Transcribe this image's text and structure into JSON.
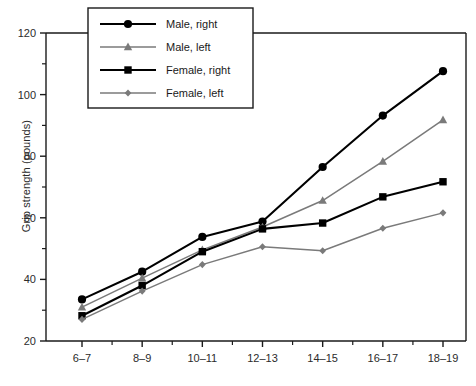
{
  "chart_data": {
    "type": "line",
    "title": "",
    "xlabel": "",
    "ylabel": "Grip strength (pounds)",
    "categories": [
      "6–7",
      "8–9",
      "10–11",
      "12–13",
      "14–15",
      "16–17",
      "18–19"
    ],
    "ylim": [
      20,
      120
    ],
    "yticks": [
      20,
      40,
      60,
      80,
      100,
      120
    ],
    "yticks_minor": [
      30,
      50,
      70,
      90,
      110
    ],
    "grid": false,
    "legend_position": "top-left-inside",
    "series": [
      {
        "name": "Male, right",
        "marker": "circle",
        "color": "#000000",
        "line_width": 2.1,
        "values": [
          33.5,
          42.5,
          53.8,
          58.8,
          76.5,
          93.2,
          107.6
        ]
      },
      {
        "name": "Male, left",
        "marker": "triangle",
        "color": "#7a7a7a",
        "line_width": 1.5,
        "values": [
          31.0,
          40.4,
          49.6,
          57.0,
          65.6,
          78.3,
          91.8
        ]
      },
      {
        "name": "Female, right",
        "marker": "square",
        "color": "#000000",
        "line_width": 2.1,
        "values": [
          28.2,
          38.0,
          49.0,
          56.4,
          58.3,
          66.8,
          71.7
        ]
      },
      {
        "name": "Female, left",
        "marker": "diamond",
        "color": "#7a7a7a",
        "line_width": 1.5,
        "values": [
          27.0,
          36.2,
          44.8,
          50.6,
          49.3,
          56.6,
          61.6
        ]
      }
    ]
  },
  "legend": {
    "items": [
      {
        "label": "Male, right"
      },
      {
        "label": "Male, left"
      },
      {
        "label": "Female, right"
      },
      {
        "label": "Female, left"
      }
    ]
  },
  "axis": {
    "y_label": "Grip strength (pounds)",
    "y_tick_labels": [
      "20",
      "40",
      "60",
      "80",
      "100",
      "120"
    ],
    "x_tick_labels": [
      "6–7",
      "8–9",
      "10–11",
      "12–13",
      "14–15",
      "16–17",
      "18–19"
    ]
  },
  "colors": {
    "right_series": "#000000",
    "left_series": "#7a7a7a",
    "axis": "#1a1a1a",
    "background": "#ffffff"
  }
}
